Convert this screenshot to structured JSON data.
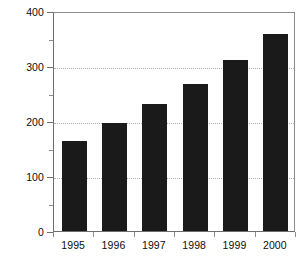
{
  "chart_data": {
    "type": "bar",
    "title": "",
    "xlabel": "",
    "ylabel": "Units (thousands)",
    "categories": [
      "1995",
      "1996",
      "1997",
      "1998",
      "1999",
      "2000"
    ],
    "values": [
      164,
      196,
      231,
      267,
      311,
      358
    ],
    "ylim": [
      0,
      400
    ],
    "ytick_labels": [
      "0",
      "100",
      "200",
      "300",
      "400"
    ],
    "ytick_values": [
      0,
      100,
      200,
      300,
      400
    ],
    "yminor_values": [
      50,
      150,
      250,
      350
    ],
    "grid": true,
    "grid_axis": "y",
    "grid_style": "dotted",
    "legend": null,
    "colors": {
      "bar": "#1a1a1a",
      "grid": "#b0b0b0",
      "axis": "#6e6e6e",
      "frame": "#8c8c8c",
      "text": "#0d0d0d",
      "background": "#ffffff"
    }
  }
}
